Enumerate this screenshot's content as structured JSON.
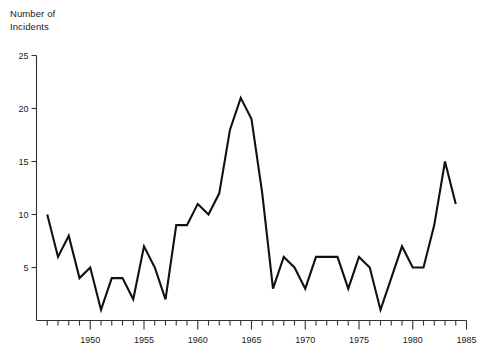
{
  "chart_data": {
    "type": "line",
    "title": "Number of Incidents",
    "xlabel": "",
    "ylabel": "Number of Incidents",
    "grid": false,
    "legend": false,
    "xlim": [
      1945,
      1985
    ],
    "ylim": [
      0,
      25
    ],
    "y_ticks": [
      5,
      10,
      15,
      20,
      25
    ],
    "x_ticks_major": [
      1950,
      1955,
      1960,
      1965,
      1970,
      1975,
      1980,
      1985
    ],
    "x_tick_interval_minor": 1,
    "line_color": "#111111",
    "x": [
      1946,
      1947,
      1948,
      1949,
      1950,
      1951,
      1952,
      1953,
      1954,
      1955,
      1956,
      1957,
      1958,
      1959,
      1960,
      1961,
      1962,
      1963,
      1964,
      1965,
      1966,
      1967,
      1968,
      1969,
      1970,
      1971,
      1972,
      1973,
      1974,
      1975,
      1976,
      1977,
      1978,
      1979,
      1980,
      1981,
      1982,
      1983,
      1984
    ],
    "values": [
      10,
      6,
      8,
      4,
      5,
      1,
      4,
      4,
      2,
      7,
      5,
      2,
      9,
      9,
      11,
      10,
      12,
      18,
      21,
      19,
      12,
      3,
      6,
      5,
      3,
      6,
      6,
      6,
      3,
      6,
      5,
      1,
      4,
      7,
      5,
      5,
      9,
      15,
      11
    ],
    "series": [
      {
        "name": "Incidents",
        "values": [
          10,
          6,
          8,
          4,
          5,
          1,
          4,
          4,
          2,
          7,
          5,
          2,
          9,
          9,
          11,
          10,
          12,
          18,
          21,
          19,
          12,
          3,
          6,
          5,
          3,
          6,
          6,
          6,
          3,
          6,
          5,
          1,
          4,
          7,
          5,
          5,
          9,
          15,
          11
        ]
      }
    ]
  },
  "labels": {
    "axis_title_line1": "Number of",
    "axis_title_line2": "Incidents",
    "y": [
      "5",
      "10",
      "15",
      "20",
      "25"
    ],
    "x": [
      "1950",
      "1955",
      "1960",
      "1965",
      "1970",
      "1975",
      "1980",
      "1985"
    ]
  }
}
